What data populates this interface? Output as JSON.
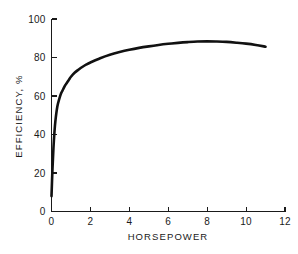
{
  "chart_data": {
    "type": "line",
    "title": "",
    "subtitle": "",
    "xlabel": "HORSEPOWER",
    "ylabel": "EFFICIENCY, %",
    "xlim": [
      0,
      12
    ],
    "ylim": [
      0,
      100
    ],
    "xticks": [
      "0",
      "2",
      "4",
      "6",
      "8",
      "10",
      "12"
    ],
    "xtick_values": [
      0,
      2,
      4,
      6,
      8,
      10,
      12
    ],
    "yticks": [
      "0",
      "20",
      "40",
      "60",
      "80",
      "100"
    ],
    "ytick_values": [
      0,
      20,
      40,
      60,
      80,
      100
    ],
    "grid": false,
    "legend": null,
    "legend_position": "none",
    "annotations": [],
    "series": [
      {
        "name": "Efficiency vs Horsepower",
        "color": "#111111",
        "x": [
          0.0,
          0.05,
          0.1,
          0.15,
          0.2,
          0.3,
          0.4,
          0.5,
          0.6,
          0.7,
          0.8,
          0.9,
          1.0,
          1.2,
          1.4,
          1.6,
          1.8,
          2.0,
          2.5,
          3.0,
          3.5,
          4.0,
          4.5,
          5.0,
          5.5,
          6.0,
          6.5,
          7.0,
          7.5,
          8.0,
          8.5,
          9.0,
          9.5,
          10.0,
          10.5,
          11.0
        ],
        "values": [
          8.0,
          22.0,
          33.0,
          41.0,
          47.0,
          54.5,
          58.5,
          61.5,
          63.5,
          65.5,
          67.0,
          68.5,
          70.0,
          72.2,
          73.8,
          75.2,
          76.4,
          77.4,
          79.6,
          81.4,
          82.8,
          84.0,
          85.0,
          85.8,
          86.5,
          87.1,
          87.6,
          88.0,
          88.3,
          88.4,
          88.3,
          88.1,
          87.7,
          87.2,
          86.5,
          85.6
        ]
      }
    ]
  },
  "axes": {
    "y_axis_title": "EFFICIENCY, %",
    "x_axis_title": "HORSEPOWER"
  }
}
